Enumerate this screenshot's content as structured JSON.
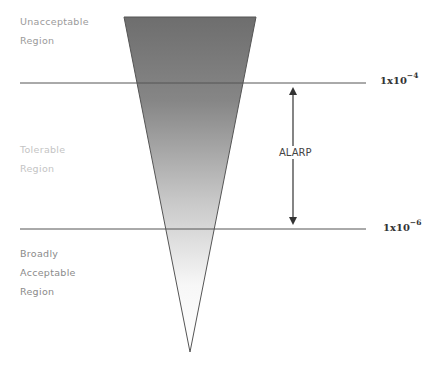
{
  "diagram": {
    "type": "ALARP risk triangle",
    "regions": [
      {
        "id": "unacceptable",
        "lines": [
          "Unacceptable",
          "Region"
        ],
        "color": "#9a9a9a"
      },
      {
        "id": "tolerable",
        "lines": [
          "Tolerable",
          "Region"
        ],
        "color": "#c4c4c4"
      },
      {
        "id": "broadly-acceptable",
        "lines": [
          "Broadly",
          "Acceptable",
          "Region"
        ],
        "color": "#8a8a8a"
      }
    ],
    "thresholds": [
      {
        "id": "upper",
        "base": "1x10",
        "exponent": "−4"
      },
      {
        "id": "lower",
        "base": "1x10",
        "exponent": "−6"
      }
    ],
    "arrow_label": "ALARP",
    "colors": {
      "triangle_top": "#6e6e6e",
      "triangle_bottom": "#ffffff",
      "lines": "#555555"
    }
  }
}
